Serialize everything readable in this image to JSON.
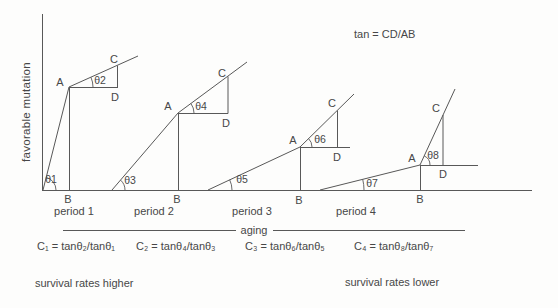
{
  "figure_title_note": "tan = CD/AB",
  "axes": {
    "y_label": "favorable mutation",
    "x_label": "aging"
  },
  "periods": [
    {
      "label": "period 1",
      "theta_origin": "θ1",
      "theta_apex": "θ2",
      "point_a": "A",
      "point_b": "B",
      "point_c": "C",
      "point_d": "D"
    },
    {
      "label": "period 2",
      "theta_origin": "θ3",
      "theta_apex": "θ4",
      "point_a": "A",
      "point_b": "B",
      "point_c": "C",
      "point_d": "D"
    },
    {
      "label": "period 3",
      "theta_origin": "θ5",
      "theta_apex": "θ6",
      "point_a": "A",
      "point_b": "B",
      "point_c": "C",
      "point_d": "D"
    },
    {
      "label": "period 4",
      "theta_origin": "θ7",
      "theta_apex": "θ8",
      "point_a": "A",
      "point_b": "B",
      "point_c": "C",
      "point_d": "D"
    }
  ],
  "coefficients": [
    "C₁ = tanθ₂/tanθ₁",
    "C₂ = tanθ₄/tanθ₃",
    "C₃ = tanθ₆/tanθ₅",
    "C₄ = tanθ₈/tanθ₇"
  ],
  "notes": {
    "left": "survival rates higher",
    "right": "survival rates lower"
  }
}
